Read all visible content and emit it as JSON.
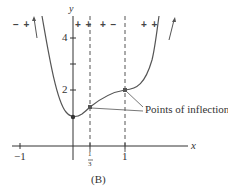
{
  "figure": {
    "caption": "(B)",
    "axis_x_label": "x",
    "axis_y_label": "y",
    "x_ticks": [
      {
        "label": "−1",
        "value": -1
      },
      {
        "label": "1/3",
        "value": 0.3333
      },
      {
        "label": "1",
        "value": 1
      }
    ],
    "y_ticks": [
      {
        "label": "2",
        "value": 2
      },
      {
        "label": "4",
        "value": 4
      }
    ],
    "sign_regions": [
      {
        "label": "− +",
        "interval": "x < 0"
      },
      {
        "label": "+ +",
        "interval": "0 < x < 1/3"
      },
      {
        "label": "+ −",
        "interval": "1/3 < x < 1"
      },
      {
        "label": "+ +",
        "interval": "x > 1"
      }
    ],
    "annotation": "Points of inflection",
    "fraction_numerator": "1",
    "fraction_denominator": "3",
    "points": [
      {
        "name": "local minimum",
        "x": 0,
        "y": 1
      },
      {
        "name": "inflection point",
        "x": 0.3333,
        "y": 1.37
      },
      {
        "name": "inflection point",
        "x": 1,
        "y": 2
      }
    ],
    "colors": {
      "curve": "#555555",
      "axis": "#333333",
      "point": "#333333"
    }
  }
}
